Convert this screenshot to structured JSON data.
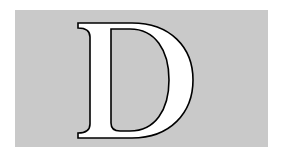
{
  "dropcap": {
    "letter": "D",
    "background_color": "#c9c9c9",
    "fill_color": "#ffffff",
    "outline_color": "#000000"
  }
}
